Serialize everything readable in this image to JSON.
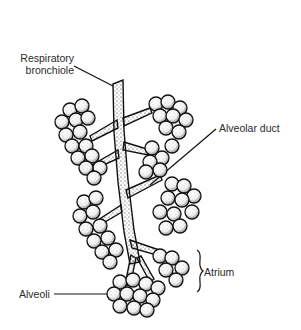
{
  "diagram": {
    "labels": {
      "respiratory_bronchiole_line1": "Respiratory",
      "respiratory_bronchiole_line2": "bronchiole",
      "alveolar_duct": "Alveolar duct",
      "atrium": "Atrium",
      "alveoli": "Alveoli"
    },
    "colors": {
      "ink": "#111111",
      "text": "#2a2a2a",
      "background": "#ffffff"
    }
  }
}
